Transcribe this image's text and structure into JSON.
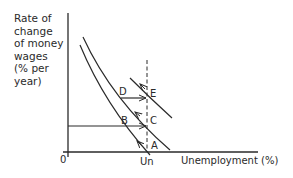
{
  "diagram": {
    "type": "phillips-curve-expectations",
    "y_axis_label": "Rate of\nchange\nof money\nwages\n(% per\nyear)",
    "x_axis_label": "Unemployment (%)",
    "origin_label": "0",
    "natural_rate_label": "Un",
    "points": {
      "A": "A",
      "B": "B",
      "C": "C",
      "D": "D",
      "E": "E"
    },
    "curves": [
      {
        "name": "short-run-phillips-curve-1",
        "from": [
          80,
          45
        ],
        "to": [
          150,
          155
        ]
      },
      {
        "name": "short-run-phillips-curve-2",
        "from": [
          83,
          37
        ],
        "to": [
          170,
          150
        ]
      },
      {
        "name": "short-run-phillips-curve-3",
        "from": [
          130,
          78
        ],
        "to": [
          172,
          118
        ]
      }
    ],
    "colors": {
      "line": "#2a2a2a",
      "background": "#ffffff"
    }
  }
}
